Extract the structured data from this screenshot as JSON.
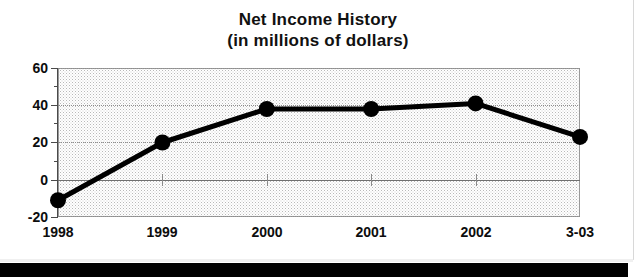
{
  "chart_data": {
    "type": "line",
    "title": "Net Income History",
    "subtitle": "(in millions of dollars)",
    "xlabel": "",
    "ylabel": "",
    "categories": [
      "1998",
      "1999",
      "2000",
      "2001",
      "2002",
      "3-03"
    ],
    "values": [
      -11,
      20,
      38,
      38,
      41,
      23
    ],
    "series": [
      {
        "name": "Net Income",
        "values": [
          -11,
          20,
          38,
          38,
          41,
          23
        ]
      }
    ],
    "ylim": [
      -20,
      60
    ],
    "yticks": [
      60,
      40,
      20,
      0,
      -20
    ],
    "ytick_labels": [
      "60",
      "40",
      "20",
      "0",
      "-20"
    ],
    "y_minor_ticks": [
      50,
      30,
      10,
      -10
    ],
    "grid": true,
    "legend": "none",
    "line_color": "#000000",
    "marker": "circle",
    "marker_color": "#000000",
    "plot_background": "#ffffff",
    "zero_line_value": 0
  },
  "titles": {
    "line1": "Net Income History",
    "line2": "(in millions of dollars)"
  },
  "axis": {
    "y_labels": [
      "60",
      "40",
      "20",
      "0",
      "-20"
    ],
    "x_labels": [
      "1998",
      "1999",
      "2000",
      "2001",
      "2002",
      "3-03"
    ]
  }
}
